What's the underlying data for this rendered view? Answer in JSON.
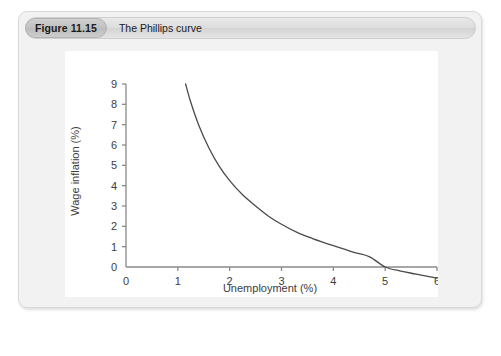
{
  "figure": {
    "badge_label": "Figure 11.15",
    "title": "The Phillips curve"
  },
  "colors": {
    "card_background": "#f2f2f2",
    "card_border": "#d9d9d9",
    "caption_background": "#dddddd",
    "badge_background": "#c2c2c2",
    "plot_background": "#ffffff",
    "axis": "#8a8a8a",
    "curve": "#4a4a4a",
    "text": "#3d3d3d"
  },
  "chart_data": {
    "type": "line",
    "title": "The Phillips curve",
    "xlabel": "Unemployment (%)",
    "ylabel": "Wage inflation (%)",
    "xlim": [
      0,
      6
    ],
    "ylim": [
      0,
      9
    ],
    "xticks": [
      0,
      1,
      2,
      3,
      4,
      5,
      6
    ],
    "yticks": [
      0,
      1,
      2,
      3,
      4,
      5,
      6,
      7,
      8,
      9
    ],
    "xtick_labels": [
      "0",
      "1",
      "2",
      "3",
      "4",
      "5",
      "6"
    ],
    "ytick_labels": [
      "0",
      "1",
      "2",
      "3",
      "4",
      "5",
      "6",
      "7",
      "8",
      "9"
    ],
    "grid": false,
    "legend": null,
    "series": [
      {
        "name": "Phillips curve",
        "color": "#4a4a4a",
        "x": [
          1.15,
          1.25,
          1.4,
          1.6,
          1.8,
          2.0,
          2.25,
          2.5,
          2.75,
          3.0,
          3.3,
          3.6,
          4.0,
          4.4,
          4.7,
          5.0,
          5.3,
          5.6,
          6.0
        ],
        "y": [
          9.0,
          8.1,
          7.0,
          5.85,
          4.95,
          4.25,
          3.55,
          3.0,
          2.5,
          2.1,
          1.7,
          1.4,
          1.05,
          0.72,
          0.5,
          0.0,
          -0.2,
          -0.35,
          -0.55
        ]
      }
    ],
    "annotations": []
  }
}
